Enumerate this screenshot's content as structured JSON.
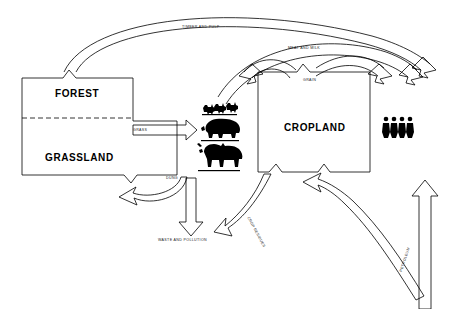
{
  "diagram": {
    "background_color": "#ffffff",
    "line_color": "#000000",
    "nodes": [
      {
        "id": "forest",
        "label": "FOREST",
        "type": "box-upper"
      },
      {
        "id": "grassland",
        "label": "GRASSLAND",
        "type": "box-lower"
      },
      {
        "id": "cropland",
        "label": "CROPLAND",
        "type": "box"
      },
      {
        "id": "livestock",
        "label": "",
        "type": "icon-group",
        "icons": [
          "chickens-icon",
          "pig-icon",
          "cattle-icon"
        ]
      },
      {
        "id": "people",
        "label": "",
        "type": "icon-group",
        "icons": [
          "person-icon",
          "person-icon",
          "person-icon",
          "person-icon"
        ]
      }
    ],
    "flows": [
      {
        "id": "timber",
        "label": "TIMBER AND PULP",
        "from": "forest",
        "to": "people",
        "style": "thin-curve"
      },
      {
        "id": "meatmilk",
        "label": "MEAT AND MILK",
        "from": "livestock",
        "to": "people",
        "style": "thin-curve"
      },
      {
        "id": "grain",
        "label": "GRAIN",
        "from": "cropland",
        "to": "people",
        "style": "thin-curve"
      },
      {
        "id": "grass",
        "label": "GRASS",
        "from": "grassland",
        "to": "livestock",
        "style": "hollow-arrow"
      },
      {
        "id": "dung",
        "label": "DUNG",
        "from": "livestock",
        "to": "grassland",
        "style": "hollow-arrow"
      },
      {
        "id": "waste",
        "label": "WASTE AND POLLUTION",
        "from": "livestock",
        "to": "environment",
        "style": "hollow-arrow"
      },
      {
        "id": "residues",
        "label": "CROP RESIDUES",
        "from": "cropland",
        "to": "livestock",
        "style": "hollow-arrow"
      },
      {
        "id": "petroleum",
        "label": "PETROLEUM",
        "from": "external",
        "to": "cropland",
        "style": "hollow-arrow-forked"
      }
    ]
  }
}
